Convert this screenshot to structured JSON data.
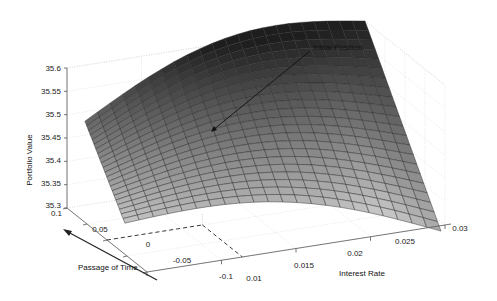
{
  "chart_data": {
    "type": "surface3d",
    "title": "",
    "xlabel": "Interest Rate",
    "ylabel": "Passage of Time",
    "zlabel": "Portfolio Value",
    "x_ticks": [
      "0.01",
      "0.015",
      "0.02",
      "0.025",
      "0.03"
    ],
    "x_range": [
      0.01,
      0.03
    ],
    "y_ticks": [
      "0.1",
      "0.05",
      "0",
      "-0.05",
      "-0.1"
    ],
    "y_range": [
      -0.1,
      0.1
    ],
    "z_ticks": [
      "35.6",
      "35.55",
      "35.5",
      "35.45",
      "35.4",
      "35.35",
      "35.3"
    ],
    "z_range": [
      35.3,
      35.6
    ],
    "grid": true,
    "colormap": "gray",
    "surface_corners": {
      "rate_0.01_time_0.1": 35.48,
      "rate_0.03_time_0.1": 35.6,
      "rate_0.03_time_-0.1": 35.3,
      "rate_0.01_time_-0.1": 35.33
    },
    "annotation": {
      "text": "Initial Position",
      "points_to": {
        "rate": 0.02,
        "time": 0.0
      }
    },
    "time_arrow": {
      "direction": "toward increasing time",
      "label": "Passage of Time"
    }
  }
}
